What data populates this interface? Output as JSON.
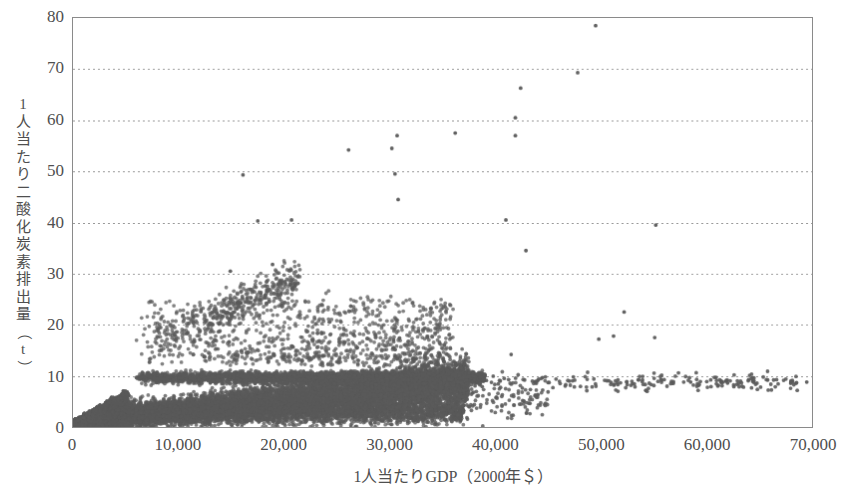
{
  "chart_data": {
    "type": "scatter",
    "title": "",
    "xlabel": "1人当たりGDP（2000年＄）",
    "ylabel": "1人当たり二酸化炭素排出量（t）",
    "xlim": [
      0,
      70000
    ],
    "ylim": [
      0,
      80
    ],
    "xticks": [
      0,
      10000,
      20000,
      30000,
      40000,
      50000,
      60000,
      70000
    ],
    "xticklabels": [
      "0",
      "10,000",
      "20,000",
      "30,000",
      "40,000",
      "50,000",
      "60,000",
      "70,000"
    ],
    "yticks": [
      0,
      10,
      20,
      30,
      40,
      50,
      60,
      70,
      80
    ],
    "yticklabels": [
      "0",
      "10",
      "20",
      "30",
      "40",
      "50",
      "60",
      "70",
      "80"
    ],
    "grid": {
      "horizontal": true,
      "vertical": false,
      "style": "dotted",
      "color": "#999999"
    },
    "legend": null,
    "marker": {
      "shape": "circle",
      "size": 3,
      "color": "#5a5a5a"
    },
    "series": [
      {
        "name": "国別・年別 観測値",
        "description": "1人当たりGDPと1人当たり二酸化炭素排出量の散布図。低所得域に非常に密な点群、所得上昇に伴い排出量も上昇し、高所得域では8〜12t付近に収束する。",
        "notable_points": [
          {
            "x": 49500,
            "y": 78.5
          },
          {
            "x": 47800,
            "y": 69.3
          },
          {
            "x": 42400,
            "y": 66.3
          },
          {
            "x": 41900,
            "y": 60.5
          },
          {
            "x": 41900,
            "y": 57.0
          },
          {
            "x": 36200,
            "y": 57.5
          },
          {
            "x": 30700,
            "y": 57.0
          },
          {
            "x": 30200,
            "y": 54.5
          },
          {
            "x": 26100,
            "y": 54.2
          },
          {
            "x": 30500,
            "y": 49.5
          },
          {
            "x": 16100,
            "y": 49.3
          },
          {
            "x": 30800,
            "y": 44.5
          },
          {
            "x": 41000,
            "y": 40.5
          },
          {
            "x": 55200,
            "y": 39.5
          },
          {
            "x": 20700,
            "y": 40.5
          },
          {
            "x": 17500,
            "y": 40.3
          },
          {
            "x": 42900,
            "y": 34.5
          },
          {
            "x": 18900,
            "y": 31.8
          },
          {
            "x": 14900,
            "y": 30.5
          },
          {
            "x": 52200,
            "y": 22.5
          },
          {
            "x": 55100,
            "y": 17.5
          },
          {
            "x": 51200,
            "y": 17.8
          },
          {
            "x": 49800,
            "y": 17.2
          },
          {
            "x": 69500,
            "y": 8.8
          },
          {
            "x": 65800,
            "y": 9.2
          },
          {
            "x": 62000,
            "y": 8.6
          },
          {
            "x": 58500,
            "y": 8.8
          },
          {
            "x": 41500,
            "y": 14.2
          }
        ]
      }
    ]
  },
  "axes": {
    "y": {
      "label": "1人当たり二酸化炭素排出量（t）",
      "label_chars": [
        "1",
        "人",
        "当",
        "た",
        "り",
        "二",
        "酸",
        "化",
        "炭",
        "素",
        "排",
        "出",
        "量",
        "（",
        "t",
        "）"
      ],
      "ticks": [
        "80",
        "70",
        "60",
        "50",
        "40",
        "30",
        "20",
        "10",
        "0"
      ]
    },
    "x": {
      "label": "1人当たりGDP（2000年＄）",
      "ticks": [
        "0",
        "10,000",
        "20,000",
        "30,000",
        "40,000",
        "50,000",
        "60,000",
        "70,000"
      ]
    }
  },
  "style": {
    "background": "#ffffff",
    "frame_color": "#8a8a8a",
    "grid_color": "#999999",
    "marker_color": "#5a5a5a",
    "text_color": "#4f4f4f"
  }
}
